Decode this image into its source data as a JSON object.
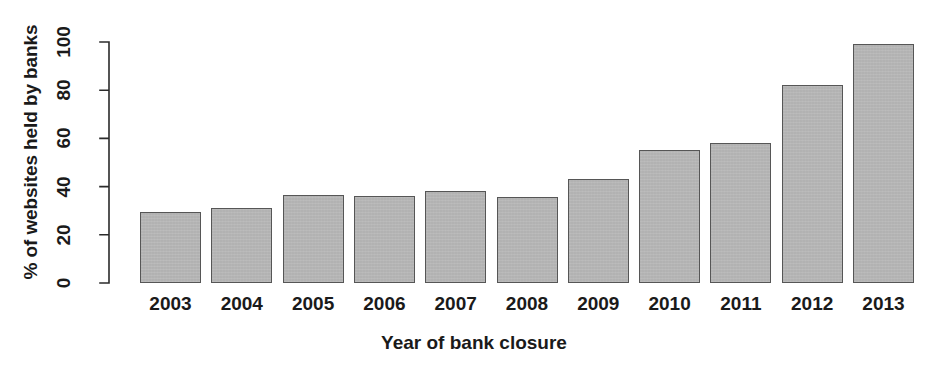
{
  "chart_data": {
    "type": "bar",
    "title": "",
    "xlabel": "Year of bank closure",
    "ylabel": "% of websites held by banks",
    "categories": [
      "2003",
      "2004",
      "2005",
      "2006",
      "2007",
      "2008",
      "2009",
      "2010",
      "2011",
      "2012",
      "2013"
    ],
    "values": [
      29.5,
      31,
      36.5,
      36,
      38,
      35.5,
      43,
      55,
      58,
      82,
      99
    ],
    "ylim": [
      0,
      100
    ],
    "yticks": [
      0,
      20,
      40,
      60,
      80,
      100
    ],
    "ytick_labels": [
      "0",
      "20",
      "40",
      "60",
      "80",
      "100"
    ],
    "grid": false,
    "legend": null,
    "bar_fill_color": "#b5b5b5",
    "bar_border_color": "#565656",
    "background_color": "#ffffff",
    "text_color": "#1a1a1a"
  }
}
